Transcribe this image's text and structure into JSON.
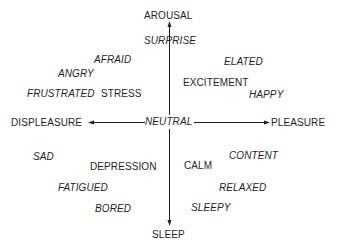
{
  "axes": {
    "top": "AROUSAL",
    "bottom": "SLEEP",
    "left": "DISPLEASURE",
    "right": "PLEASURE",
    "center": "NEUTRAL"
  },
  "emotions": {
    "surprise": "SURPRISE",
    "afraid": "AFRAID",
    "angry": "ANGRY",
    "frustrated": "FRUSTRATED",
    "stress": "STRESS",
    "elated": "ELATED",
    "excitement": "EXCITEMENT",
    "happy": "HAPPY",
    "sad": "SAD",
    "depression": "DEPRESSION",
    "fatigued": "FATIGUED",
    "bored": "BORED",
    "content": "CONTENT",
    "calm": "CALM",
    "relaxed": "RELAXED",
    "sleepy": "SLEEPY"
  },
  "colors": {
    "text": "#231f20",
    "line": "#231f20",
    "background": "#ffffff"
  }
}
